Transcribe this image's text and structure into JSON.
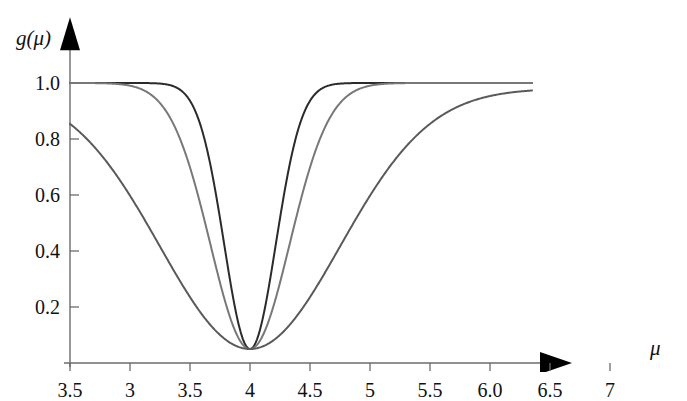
{
  "figure": {
    "width": 687,
    "height": 372,
    "background": "#ffffff"
  },
  "axes": {
    "y_title": "g(μ)",
    "x_title": "μ",
    "axis_color": "#6b6b6b",
    "arrow_color": "#000000"
  },
  "chart_data": {
    "type": "line",
    "title": "",
    "subtitle": "",
    "xlabel": "μ",
    "ylabel": "g(μ)",
    "xlim": [
      3.5,
      7.35
    ],
    "ylim": [
      0.0,
      1.06
    ],
    "grid": false,
    "legend": "none",
    "x_tick_labels": [
      "3.5",
      "3",
      "3.5",
      "4",
      "4.5",
      "5",
      "5.5",
      "6.0",
      "6.5",
      "7"
    ],
    "x_tick_values": [
      3.5,
      3.0,
      3.5,
      4.0,
      4.5,
      5.0,
      5.5,
      6.0,
      6.5,
      7.0
    ],
    "x_tick_pixels": [
      70,
      130,
      190,
      250,
      310,
      370,
      430,
      490,
      550,
      610
    ],
    "y_tick_labels": [
      "1.0",
      "0.8",
      "0.6",
      "0.4",
      "0.2"
    ],
    "y_tick_values": [
      1.0,
      0.8,
      0.6,
      0.4,
      0.2
    ],
    "y_tick_pixels": [
      83,
      139,
      195,
      251,
      307
    ],
    "annotations": [
      "Three inverted-Gaussian notch curves centred at μ = 5",
      "All curves share a common minimum value of about 0.05",
      "Plateau value of 1.0 away from the notch",
      "First x tick is labelled 3.5 (duplicate of the third tick label)"
    ],
    "series": [
      {
        "name": "narrow",
        "color": "#2b2b2b",
        "linewidth": 2.0,
        "center": 5.0,
        "sigma": 0.215,
        "baseline": 1.0,
        "minimum": 0.05,
        "x": [
          3.5,
          3.7,
          3.9,
          4.1,
          4.3,
          4.4,
          4.5,
          4.6,
          4.7,
          4.8,
          4.9,
          5.0,
          5.1,
          5.2,
          5.3,
          5.4,
          5.5,
          5.6,
          5.7,
          5.9,
          6.1,
          6.3,
          6.6,
          7.0,
          7.35
        ],
        "y": [
          1.0,
          1.0,
          1.0,
          0.999,
          0.992,
          0.979,
          0.947,
          0.878,
          0.76,
          0.595,
          0.412,
          0.05,
          0.412,
          0.595,
          0.76,
          0.878,
          0.947,
          0.979,
          0.992,
          1.0,
          1.0,
          1.0,
          1.0,
          1.0,
          1.0
        ]
      },
      {
        "name": "medium",
        "color": "#787878",
        "linewidth": 2.0,
        "center": 5.0,
        "sigma": 0.33,
        "baseline": 1.0,
        "minimum": 0.05,
        "x": [
          3.5,
          3.8,
          4.0,
          4.2,
          4.3,
          4.4,
          4.5,
          4.6,
          4.7,
          4.8,
          4.9,
          5.0,
          5.1,
          5.2,
          5.3,
          5.4,
          5.5,
          5.6,
          5.7,
          5.8,
          6.0,
          6.2,
          6.5,
          7.0,
          7.35
        ],
        "y": [
          1.0,
          1.0,
          0.999,
          0.992,
          0.981,
          0.956,
          0.906,
          0.822,
          0.702,
          0.555,
          0.399,
          0.05,
          0.399,
          0.555,
          0.702,
          0.822,
          0.906,
          0.956,
          0.981,
          0.992,
          0.999,
          1.0,
          1.0,
          1.0,
          1.0
        ]
      },
      {
        "name": "wide",
        "color": "#5a5a5a",
        "linewidth": 2.0,
        "center": 5.0,
        "sigma": 0.75,
        "baseline": 0.98,
        "minimum": 0.05,
        "x": [
          3.5,
          3.7,
          3.9,
          4.1,
          4.3,
          4.5,
          4.7,
          4.9,
          5.0,
          5.1,
          5.3,
          5.5,
          5.7,
          5.9,
          6.1,
          6.3,
          6.5,
          6.7,
          6.9,
          7.1,
          7.35
        ],
        "y": [
          0.976,
          0.95,
          0.905,
          0.836,
          0.742,
          0.625,
          0.492,
          0.352,
          0.05,
          0.352,
          0.492,
          0.625,
          0.742,
          0.836,
          0.905,
          0.95,
          0.976,
          0.955,
          0.963,
          0.968,
          0.972
        ]
      }
    ]
  }
}
